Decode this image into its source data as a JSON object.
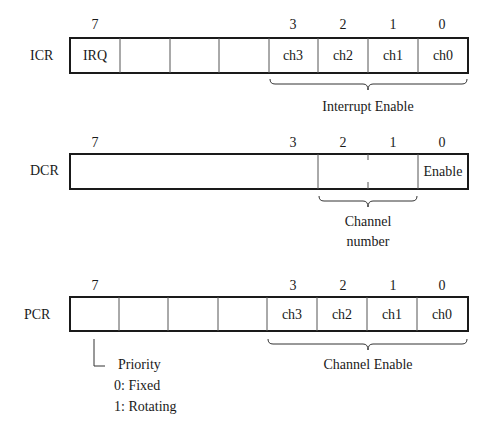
{
  "registers": [
    {
      "name": "ICR",
      "bit_labels": [
        {
          "bit": "7",
          "x": 95
        },
        {
          "bit": "3",
          "x": 293
        },
        {
          "bit": "2",
          "x": 343
        },
        {
          "bit": "1",
          "x": 393
        },
        {
          "bit": "0",
          "x": 442
        }
      ],
      "cells": [
        "IRQ",
        "",
        "",
        "",
        "ch3",
        "ch2",
        "ch1",
        "ch0"
      ],
      "brace_label": "Interrupt Enable"
    },
    {
      "name": "DCR",
      "bit_labels": [
        {
          "bit": "7",
          "x": 95
        },
        {
          "bit": "3",
          "x": 293
        },
        {
          "bit": "2",
          "x": 343
        },
        {
          "bit": "1",
          "x": 393
        },
        {
          "bit": "0",
          "x": 442
        }
      ],
      "cells": [
        "",
        "",
        "Enable"
      ],
      "brace_label_line1": "Channel",
      "brace_label_line2": "number"
    },
    {
      "name": "PCR",
      "bit_labels": [
        {
          "bit": "7",
          "x": 95
        },
        {
          "bit": "3",
          "x": 293
        },
        {
          "bit": "2",
          "x": 343
        },
        {
          "bit": "1",
          "x": 393
        },
        {
          "bit": "0",
          "x": 442
        }
      ],
      "cells": [
        "",
        "",
        "",
        "",
        "ch3",
        "ch2",
        "ch1",
        "ch0"
      ],
      "brace_label": "Channel Enable",
      "priority_note": {
        "title": "Priority",
        "options": [
          "0: Fixed",
          "1: Rotating"
        ]
      }
    }
  ]
}
